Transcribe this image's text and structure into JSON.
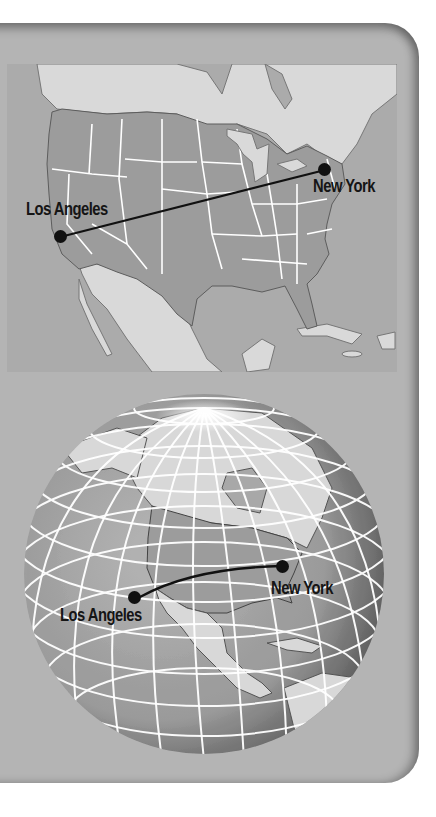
{
  "figure": {
    "colors": {
      "panel": "#b4b4b4",
      "ocean": "#ababab",
      "us_land": "#9c9c9c",
      "other_land": "#d9d9d9",
      "state_borders": "#ffffff",
      "route": "#111111",
      "labels": "#151515"
    }
  },
  "flat_map": {
    "projection": "flat",
    "route_type": "straight line",
    "cities": [
      {
        "name": "Los Angeles",
        "x": 60,
        "y": 237
      },
      {
        "name": "New York",
        "x": 325,
        "y": 170
      }
    ]
  },
  "globe_map": {
    "projection": "globe",
    "route_type": "curved arc",
    "cities": [
      {
        "name": "Los Angeles",
        "x": 134,
        "y": 597
      },
      {
        "name": "New York",
        "x": 282,
        "y": 566
      }
    ]
  }
}
